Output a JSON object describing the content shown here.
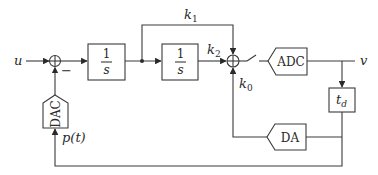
{
  "diagram": {
    "type": "block-diagram",
    "signals": {
      "input": "u",
      "output": "v",
      "pulse": "p(t)"
    },
    "summing_junctions": [
      {
        "id": "sum1",
        "inputs": [
          "u",
          "DAC output"
        ],
        "signs": [
          "+",
          "-"
        ],
        "minus_label": "−"
      },
      {
        "id": "sum2",
        "inputs": [
          "k1",
          "k2",
          "k0"
        ]
      }
    ],
    "blocks": [
      {
        "id": "integrator1",
        "num": "1",
        "den": "s"
      },
      {
        "id": "integrator2",
        "num": "1",
        "den": "s"
      },
      {
        "id": "adc",
        "label": "ADC"
      },
      {
        "id": "delay",
        "label": "t",
        "subscript": "d"
      },
      {
        "id": "da",
        "label": "DA"
      },
      {
        "id": "dac",
        "label": "DAC"
      }
    ],
    "gains": {
      "k1": {
        "base": "k",
        "sub": "1"
      },
      "k2": {
        "base": "k",
        "sub": "2"
      },
      "k0": {
        "base": "k",
        "sub": "0"
      }
    }
  }
}
